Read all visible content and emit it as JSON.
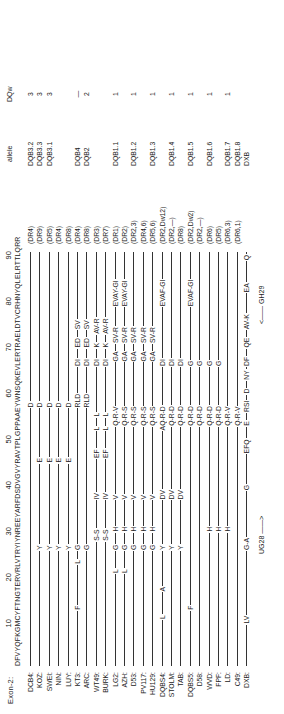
{
  "header": {
    "exon_label": "Exon-2:",
    "ruler": [
      "10",
      "20",
      "30",
      "40",
      "50",
      "60",
      "70",
      "80",
      "90"
    ],
    "reference_sequence": "DFVYQFKGMCYFTNGTERVRLVTRYIYNREEYARFDSDVGVYRAVTPLGPPAAEYWNSQKEVLERTRAELDTVCRHNYQLELRTTLQRR",
    "col_allele": "allele",
    "col_dqw": "DQw"
  },
  "rows": [
    {
      "label": "DCB4:",
      "mut": [
        {
          "p": 57,
          "t": "D"
        }
      ],
      "dr": "(DR4)",
      "allele": "DQB3.2",
      "dqw": "3"
    },
    {
      "label": "KOZ:",
      "mut": [
        {
          "p": 26,
          "t": "Y"
        },
        {
          "p": 45,
          "t": "E"
        },
        {
          "p": 57,
          "t": "D"
        }
      ],
      "dr": "(DR9)",
      "allele": "DQB3.3",
      "dqw": "3"
    },
    {
      "label": "SWEI:",
      "mut": [
        {
          "p": 26,
          "t": "Y"
        },
        {
          "p": 45,
          "t": "E"
        },
        {
          "p": 57,
          "t": "D"
        }
      ],
      "dr": "(DR5)",
      "allele": "DQB3.1",
      "dqw": "3"
    },
    {
      "label": "NIN:",
      "mut": [
        {
          "p": 26,
          "t": "Y"
        },
        {
          "p": 45,
          "t": "E"
        },
        {
          "p": 57,
          "t": "D"
        }
      ],
      "dr": "(DR4)",
      "allele": "",
      "dqw": ""
    },
    {
      "label": "LUY:",
      "mut": [
        {
          "p": 26,
          "t": "Y"
        },
        {
          "p": 45,
          "t": "E"
        },
        {
          "p": 57,
          "t": "D"
        }
      ],
      "dr": "(DR8)",
      "allele": "",
      "dqw": ""
    },
    {
      "label": "KT3:",
      "mut": [
        {
          "p": 13,
          "t": "F"
        },
        {
          "p": 23,
          "t": "L"
        },
        {
          "p": 26,
          "t": "G"
        },
        {
          "p": 57,
          "t": "RLD"
        },
        {
          "p": 66,
          "t": "DI"
        },
        {
          "p": 70,
          "t": "ED"
        },
        {
          "p": 74,
          "t": "SV"
        }
      ],
      "dr": "(DR4)",
      "allele": "DQB4",
      "dqw": "—"
    },
    {
      "label": "ARC:",
      "mut": [
        {
          "p": 26,
          "t": "G"
        },
        {
          "p": 57,
          "t": "RLD"
        },
        {
          "p": 66,
          "t": "DI"
        },
        {
          "p": 70,
          "t": "ED"
        },
        {
          "p": 74,
          "t": "SV"
        }
      ],
      "dr": "(DR8)",
      "allele": "DQB2",
      "dqw": "2"
    },
    {
      "label": "WT49:",
      "mut": [
        {
          "p": 28,
          "t": "S-S"
        },
        {
          "p": 37,
          "t": "IV"
        },
        {
          "p": 46,
          "t": "EF"
        },
        {
          "p": 52,
          "t": "L"
        },
        {
          "p": 55,
          "t": "L"
        },
        {
          "p": 66,
          "t": "DI"
        },
        {
          "p": 70,
          "t": "K"
        },
        {
          "p": 73,
          "t": "AV-R"
        }
      ],
      "dr": "(DR3)",
      "allele": "",
      "dqw": ""
    },
    {
      "label": "BURK:",
      "mut": [
        {
          "p": 28,
          "t": "S-S"
        },
        {
          "p": 37,
          "t": "IV"
        },
        {
          "p": 46,
          "t": "EF"
        },
        {
          "p": 52,
          "t": "L"
        },
        {
          "p": 55,
          "t": "L"
        },
        {
          "p": 66,
          "t": "DI"
        },
        {
          "p": 70,
          "t": "K"
        },
        {
          "p": 73,
          "t": "AV-R"
        }
      ],
      "dr": "(DR7)",
      "allele": "",
      "dqw": ""
    },
    {
      "label": "LG2:",
      "mut": [
        {
          "p": 21,
          "t": "L"
        },
        {
          "p": 26,
          "t": "G"
        },
        {
          "p": 30,
          "t": "H"
        },
        {
          "p": 37,
          "t": "V"
        },
        {
          "p": 53,
          "t": "Q-R-V"
        },
        {
          "p": 67,
          "t": "GA"
        },
        {
          "p": 71,
          "t": "SV-R"
        },
        {
          "p": 79,
          "t": "EVAY-GI"
        }
      ],
      "dr": "(DR1)",
      "allele": "DQB1.1",
      "dqw": "1"
    },
    {
      "label": "AZH:",
      "mut": [
        {
          "p": 21,
          "t": "L"
        },
        {
          "p": 26,
          "t": "G"
        },
        {
          "p": 30,
          "t": "H"
        },
        {
          "p": 37,
          "t": "V"
        },
        {
          "p": 53,
          "t": "Q-R-S"
        },
        {
          "p": 67,
          "t": "GA"
        },
        {
          "p": 71,
          "t": "SV-R"
        },
        {
          "p": 79,
          "t": "EVAY-GI"
        }
      ],
      "dr": "(DR2)",
      "allele": "",
      "dqw": ""
    },
    {
      "label": "D53:",
      "mut": [
        {
          "p": 26,
          "t": "G"
        },
        {
          "p": 30,
          "t": "H"
        },
        {
          "p": 37,
          "t": "V"
        },
        {
          "p": 53,
          "t": "Q-R-S"
        },
        {
          "p": 67,
          "t": "GA"
        },
        {
          "p": 71,
          "t": "SV-R"
        }
      ],
      "dr": "(DR2,3)",
      "allele": "DQB1.2",
      "dqw": "1"
    },
    {
      "label": "PV117:",
      "mut": [
        {
          "p": 26,
          "t": "G"
        },
        {
          "p": 30,
          "t": "H"
        },
        {
          "p": 37,
          "t": "V"
        },
        {
          "p": 53,
          "t": "Q-R-S"
        },
        {
          "p": 67,
          "t": "GA"
        },
        {
          "p": 71,
          "t": "SV-R"
        }
      ],
      "dr": "(DR4,6)",
      "allele": "",
      "dqw": ""
    },
    {
      "label": "HU129:",
      "mut": [
        {
          "p": 26,
          "t": "G"
        },
        {
          "p": 30,
          "t": "H"
        },
        {
          "p": 37,
          "t": "V"
        },
        {
          "p": 53,
          "t": "Q-R-S"
        },
        {
          "p": 67,
          "t": "GA"
        },
        {
          "p": 71,
          "t": "SV-R"
        }
      ],
      "dr": "(DR5,6)",
      "allele": "DQB1.3",
      "dqw": "1"
    },
    {
      "label": "DQBS4:",
      "mut": [
        {
          "p": 11,
          "t": "L"
        },
        {
          "p": 17,
          "t": "A"
        },
        {
          "p": 26,
          "t": "Y"
        },
        {
          "p": 37,
          "t": "DV"
        },
        {
          "p": 52,
          "t": "AQ-R-D"
        },
        {
          "p": 66,
          "t": "DI"
        },
        {
          "p": 79,
          "t": "EVAF-GI"
        }
      ],
      "dr": "(DR2,Dw12)",
      "allele": "",
      "dqw": ""
    },
    {
      "label": "STOLM:",
      "mut": [
        {
          "p": 26,
          "t": "Y"
        },
        {
          "p": 37,
          "t": "DV"
        },
        {
          "p": 53,
          "t": "Q-R-D"
        },
        {
          "p": 66,
          "t": "DI"
        }
      ],
      "dr": "(DR2,—)",
      "allele": "DQB1.4",
      "dqw": "1"
    },
    {
      "label": "TAB:",
      "mut": [
        {
          "p": 26,
          "t": "Y"
        },
        {
          "p": 37,
          "t": "DV"
        },
        {
          "p": 53,
          "t": "Q-R-D"
        },
        {
          "p": 66,
          "t": "DI"
        }
      ],
      "dr": "(DR8)",
      "allele": "",
      "dqw": ""
    },
    {
      "label": "DQBS5:",
      "mut": [
        {
          "p": 13,
          "t": "F"
        },
        {
          "p": 53,
          "t": "Q-R-D"
        },
        {
          "p": 66,
          "t": "G"
        },
        {
          "p": 79,
          "t": "EVAF-GI"
        }
      ],
      "dr": "(DR2,Dw2)",
      "allele": "DQB1.5",
      "dqw": "1"
    },
    {
      "label": "D58:",
      "mut": [
        {
          "p": 53,
          "t": "Q-R-D"
        },
        {
          "p": 66,
          "t": "G"
        }
      ],
      "dr": "(DR2,—)",
      "allele": "",
      "dqw": ""
    },
    {
      "label": "WVD:",
      "mut": [
        {
          "p": 30,
          "t": "H"
        },
        {
          "p": 53,
          "t": "Q-R-D"
        },
        {
          "p": 66,
          "t": "G"
        }
      ],
      "dr": "(DR6)",
      "allele": "DQB1.6",
      "dqw": "1"
    },
    {
      "label": "FPF:",
      "mut": [
        {
          "p": 30,
          "t": "H"
        },
        {
          "p": 53,
          "t": "Q-R-D"
        },
        {
          "p": 66,
          "t": "G"
        }
      ],
      "dr": "(DR5)",
      "allele": "",
      "dqw": ""
    },
    {
      "label": "LD:",
      "mut": [
        {
          "p": 30,
          "t": "H"
        },
        {
          "p": 53,
          "t": "Q-R-V"
        }
      ],
      "dr": "(DR6,3)",
      "allele": "DQB1.7",
      "dqw": "1"
    },
    {
      "label": "C49:",
      "mut": [
        {
          "p": 53,
          "t": "Q-R-V"
        }
      ],
      "dr": "(DR6,1)",
      "allele": "DQB1.8",
      "dqw": ""
    },
    {
      "label": "DXB:",
      "mut": [
        {
          "p": 10,
          "t": "LV"
        },
        {
          "p": 26,
          "t": "G-A"
        },
        {
          "p": 39,
          "t": "G"
        },
        {
          "p": 47,
          "t": "EFQ"
        },
        {
          "p": 53,
          "t": "E"
        },
        {
          "p": 56,
          "t": "RSI"
        },
        {
          "p": 60,
          "t": "D"
        },
        {
          "p": 63,
          "t": "NY"
        },
        {
          "p": 66,
          "t": "DF"
        },
        {
          "p": 70,
          "t": "QE"
        },
        {
          "p": 74,
          "t": "AV-K"
        },
        {
          "p": 82,
          "t": "EA"
        },
        {
          "p": 89,
          "t": "Q"
        }
      ],
      "dr": "",
      "allele": "DXB",
      "dqw": ""
    }
  ],
  "primers": {
    "forward": "UG28 ——>",
    "reverse": "<—— GH29"
  }
}
